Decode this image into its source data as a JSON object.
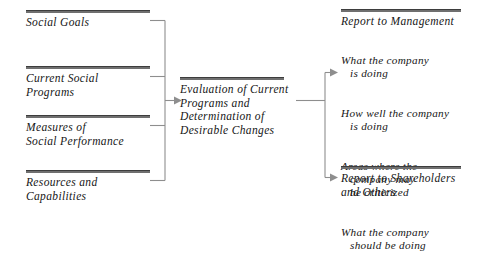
{
  "diagram": {
    "title": "Evaluation of Current Programs and Determination of Desirable Changes",
    "accent_color": "#6f6f6f",
    "connector_color": "#8e8e8e",
    "inputs": [
      {
        "id": "social-goals",
        "label": "Social Goals"
      },
      {
        "id": "current-social-programs",
        "label": "Current Social\nPrograms"
      },
      {
        "id": "measures-of-social-performance",
        "label": "Measures of\nSocial Performance"
      },
      {
        "id": "resources-and-capabilities",
        "label": "Resources and\nCapabilities"
      }
    ],
    "process": {
      "id": "evaluation-process",
      "label": "Evaluation of Current\nPrograms and\nDetermination of\nDesirable Changes"
    },
    "outputs": [
      {
        "id": "report-to-management",
        "label": "Report to Management",
        "items": [
          {
            "first": "What the company",
            "rest": "is doing"
          },
          {
            "first": "How well the company",
            "rest": "is doing"
          },
          {
            "first": "Areas where the",
            "rest": "company may\nbe criticized"
          },
          {
            "first": "What the company",
            "rest": "should be doing"
          }
        ]
      },
      {
        "id": "report-to-shareholders-and-others",
        "label": "Report to Shareholders\nand Others",
        "items": []
      }
    ]
  }
}
